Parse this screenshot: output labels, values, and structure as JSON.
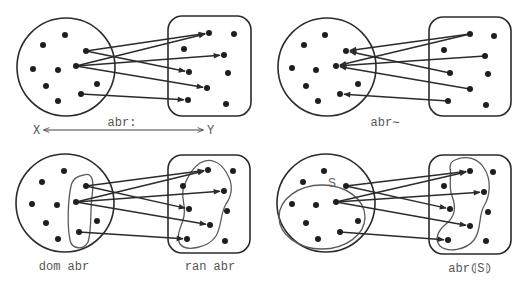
{
  "panels": [
    {
      "id": "relation",
      "label_source": "X",
      "label_target": "Y",
      "label_relation": "abr:",
      "domain_circle": {
        "cx": 66,
        "cy": 67,
        "r": 49
      },
      "codomain_rect": {
        "x": 168,
        "y": 16,
        "w": 83,
        "h": 100,
        "rx": 14
      },
      "x_dots": [
        [
          65,
          35
        ],
        [
          43,
          45
        ],
        [
          33,
          69
        ],
        [
          58,
          70
        ],
        [
          76,
          66
        ],
        [
          86,
          51
        ],
        [
          46,
          86
        ],
        [
          97,
          84
        ],
        [
          58,
          101
        ],
        [
          81,
          94
        ]
      ],
      "y_dots": [
        [
          209,
          33
        ],
        [
          234,
          34
        ],
        [
          184,
          49
        ],
        [
          224,
          55
        ],
        [
          189,
          72
        ],
        [
          228,
          73
        ],
        [
          207,
          88
        ],
        [
          188,
          100
        ],
        [
          226,
          104
        ]
      ],
      "arrows": [
        {
          "from": [
            86,
            51
          ],
          "to": [
            209,
            33
          ]
        },
        {
          "from": [
            86,
            51
          ],
          "to": [
            189,
            72
          ]
        },
        {
          "from": [
            76,
            66
          ],
          "to": [
            209,
            33
          ]
        },
        {
          "from": [
            76,
            66
          ],
          "to": [
            224,
            55
          ]
        },
        {
          "from": [
            76,
            66
          ],
          "to": [
            207,
            88
          ]
        },
        {
          "from": [
            81,
            94
          ],
          "to": [
            188,
            100
          ]
        }
      ]
    },
    {
      "id": "inverse",
      "label": "abr∼",
      "domain_circle": {
        "cx": 327,
        "cy": 67,
        "r": 49
      },
      "codomain_rect": {
        "x": 429,
        "y": 17,
        "w": 82,
        "h": 99,
        "rx": 14
      },
      "x_dots": [
        [
          325,
          35
        ],
        [
          304,
          45
        ],
        [
          292,
          68
        ],
        [
          316,
          70
        ],
        [
          336,
          66
        ],
        [
          346,
          51
        ],
        [
          306,
          86
        ],
        [
          358,
          84
        ],
        [
          318,
          101
        ],
        [
          340,
          94
        ]
      ],
      "y_dots": [
        [
          470,
          34
        ],
        [
          494,
          36
        ],
        [
          444,
          50
        ],
        [
          485,
          56
        ],
        [
          450,
          73
        ],
        [
          488,
          74
        ],
        [
          470,
          89
        ],
        [
          448,
          101
        ],
        [
          486,
          105
        ]
      ],
      "arrows": [
        {
          "from": [
            470,
            34
          ],
          "to": [
            346,
            51
          ]
        },
        {
          "from": [
            450,
            73
          ],
          "to": [
            346,
            51
          ]
        },
        {
          "from": [
            470,
            34
          ],
          "to": [
            336,
            66
          ]
        },
        {
          "from": [
            485,
            56
          ],
          "to": [
            336,
            66
          ]
        },
        {
          "from": [
            470,
            89
          ],
          "to": [
            336,
            66
          ]
        },
        {
          "from": [
            448,
            101
          ],
          "to": [
            340,
            94
          ]
        }
      ]
    },
    {
      "id": "domain-range",
      "label_domain": "dom abr",
      "label_range": "ran abr",
      "domain_circle": {
        "cx": 65,
        "cy": 203,
        "r": 49
      },
      "codomain_rect": {
        "x": 168,
        "y": 155,
        "w": 82,
        "h": 98,
        "rx": 14
      },
      "x_dots": [
        [
          64,
          171
        ],
        [
          42,
          182
        ],
        [
          32,
          204
        ],
        [
          57,
          205
        ],
        [
          76,
          202
        ],
        [
          86,
          186
        ],
        [
          46,
          223
        ],
        [
          97,
          221
        ],
        [
          58,
          239
        ],
        [
          79,
          232
        ]
      ],
      "y_dots": [
        [
          208,
          170
        ],
        [
          233,
          171
        ],
        [
          183,
          186
        ],
        [
          224,
          191
        ],
        [
          189,
          209
        ],
        [
          227,
          211
        ],
        [
          210,
          225
        ],
        [
          187,
          239
        ],
        [
          225,
          241
        ]
      ],
      "arrows": [
        {
          "from": [
            86,
            186
          ],
          "to": [
            208,
            170
          ]
        },
        {
          "from": [
            86,
            186
          ],
          "to": [
            189,
            209
          ]
        },
        {
          "from": [
            76,
            202
          ],
          "to": [
            208,
            170
          ]
        },
        {
          "from": [
            76,
            202
          ],
          "to": [
            224,
            191
          ]
        },
        {
          "from": [
            76,
            202
          ],
          "to": [
            210,
            225
          ]
        },
        {
          "from": [
            79,
            232
          ],
          "to": [
            187,
            239
          ]
        }
      ]
    },
    {
      "id": "relational-image",
      "label_subset": "S",
      "label_image": "abr⦇S⦈",
      "domain_circle": {
        "cx": 326,
        "cy": 203,
        "r": 49
      },
      "codomain_rect": {
        "x": 429,
        "y": 155,
        "w": 82,
        "h": 99,
        "rx": 14
      },
      "x_dots": [
        [
          324,
          171
        ],
        [
          303,
          182
        ],
        [
          292,
          204
        ],
        [
          316,
          205
        ],
        [
          336,
          202
        ],
        [
          346,
          186
        ],
        [
          306,
          223
        ],
        [
          358,
          221
        ],
        [
          318,
          239
        ],
        [
          340,
          232
        ]
      ],
      "y_dots": [
        [
          470,
          171
        ],
        [
          493,
          172
        ],
        [
          444,
          186
        ],
        [
          484,
          192
        ],
        [
          450,
          209
        ],
        [
          488,
          212
        ],
        [
          470,
          226
        ],
        [
          448,
          240
        ],
        [
          486,
          241
        ]
      ],
      "arrows": [
        {
          "from": [
            346,
            186
          ],
          "to": [
            470,
            171
          ]
        },
        {
          "from": [
            346,
            186
          ],
          "to": [
            450,
            209
          ]
        },
        {
          "from": [
            336,
            202
          ],
          "to": [
            470,
            171
          ]
        },
        {
          "from": [
            336,
            202
          ],
          "to": [
            484,
            192
          ]
        },
        {
          "from": [
            336,
            202
          ],
          "to": [
            470,
            226
          ]
        },
        {
          "from": [
            340,
            232
          ],
          "to": [
            448,
            240
          ]
        }
      ]
    }
  ]
}
